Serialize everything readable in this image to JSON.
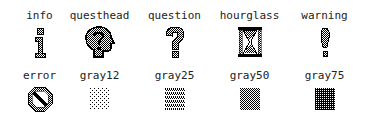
{
  "window": {
    "title": "Tk built-in bitmaps"
  },
  "bitmaps": [
    {
      "name": "info",
      "icon": "info-icon"
    },
    {
      "name": "questhead",
      "icon": "questhead-icon"
    },
    {
      "name": "question",
      "icon": "question-icon"
    },
    {
      "name": "hourglass",
      "icon": "hourglass-icon"
    },
    {
      "name": "warning",
      "icon": "warning-icon"
    },
    {
      "name": "error",
      "icon": "error-icon"
    },
    {
      "name": "gray12",
      "icon": "gray12-icon"
    },
    {
      "name": "gray25",
      "icon": "gray25-icon"
    },
    {
      "name": "gray50",
      "icon": "gray50-icon"
    },
    {
      "name": "gray75",
      "icon": "gray75-icon"
    }
  ],
  "colors": {
    "foreground": "#000000",
    "background": "#ffffff"
  }
}
